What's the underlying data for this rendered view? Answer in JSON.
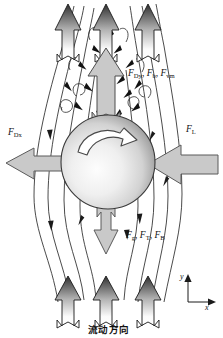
{
  "figure": {
    "background_color": "#ffffff",
    "width": 223,
    "height": 338
  },
  "labels": {
    "drag_x": {
      "symbol": "F",
      "subscript": "Dx",
      "text": "F_Dx"
    },
    "lift": {
      "symbol": "F",
      "subscript": "L",
      "text": "F_L"
    },
    "upper_group": {
      "text": "F_Dy , F_b , F_vm",
      "terms": [
        {
          "symbol": "F",
          "subscript": "Dy"
        },
        {
          "symbol": "F",
          "subscript": "b"
        },
        {
          "symbol": "F",
          "subscript": "vm"
        }
      ]
    },
    "lower_group": {
      "text": "F_g , F_T , F_B",
      "terms": [
        {
          "symbol": "F",
          "subscript": "g"
        },
        {
          "symbol": "F",
          "subscript": "T"
        },
        {
          "symbol": "F",
          "subscript": "B"
        }
      ]
    },
    "flow_direction": "流动方向",
    "axis_x": "x",
    "axis_y": "y"
  },
  "colors": {
    "stroke": "#1a1a1a",
    "force_arrow_fill": "#c9c9c9",
    "force_arrow_stroke": "#555555",
    "sphere_light": "#fbfbfb",
    "sphere_mid": "#d8d8d8",
    "sphere_dark": "#8f8f8f",
    "flow_arrow_tip": "#3b3b3b",
    "flow_arrow_base": "#ffffff",
    "streamline": "#2b2b2b"
  },
  "elements": {
    "sphere": {
      "cx": 108,
      "cy": 162,
      "r": 47,
      "spin": "clockwise"
    },
    "flow_arrows_top": [
      {
        "x": 68
      },
      {
        "x": 106
      },
      {
        "x": 148
      }
    ],
    "flow_arrows_bottom": [
      {
        "x": 68
      },
      {
        "x": 106
      },
      {
        "x": 148
      }
    ],
    "force_arrow_up": {
      "direction": "up"
    },
    "force_arrow_down": {
      "direction": "down"
    },
    "force_arrow_left": {
      "direction": "left"
    },
    "force_arrow_right": {
      "direction": "right"
    },
    "axis_indicator": {
      "origin_x": 188,
      "origin_y": 302
    }
  }
}
